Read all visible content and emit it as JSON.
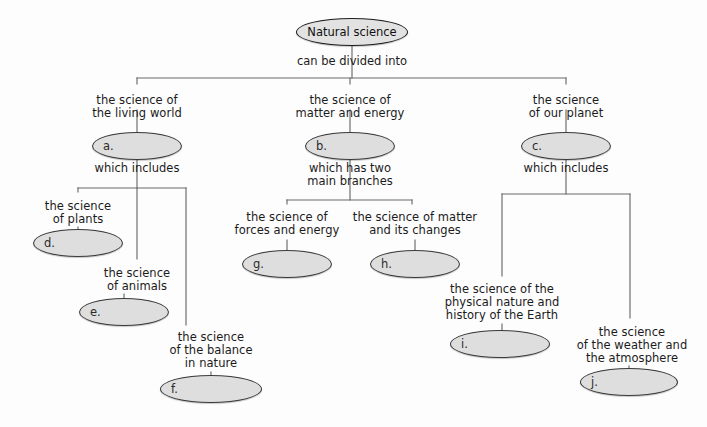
{
  "diagram": {
    "title": "Natural science",
    "type": "concept-map",
    "root": {
      "text": "Natural science",
      "cx": 352,
      "cy": 32,
      "rx": 55,
      "ry": 13
    },
    "connector_labels": [
      {
        "name": "root-connector",
        "text": "can be divided into",
        "x": 352,
        "y": 55
      },
      {
        "name": "living-world-connector",
        "text": "which includes",
        "x": 137,
        "y": 162
      },
      {
        "name": "matter-energy-connector",
        "text": "which has two\nmain branches",
        "x": 350,
        "y": 162
      },
      {
        "name": "our-planet-connector",
        "text": "which includes",
        "x": 566,
        "y": 162
      }
    ],
    "branch_labels": [
      {
        "name": "label-living-world",
        "text": "the science of\nthe living world",
        "x": 137,
        "y": 94
      },
      {
        "name": "label-matter-energy",
        "text": "the science of\nmatter and energy",
        "x": 350,
        "y": 94
      },
      {
        "name": "label-our-planet",
        "text": "the science\nof our planet",
        "x": 566,
        "y": 94
      },
      {
        "name": "label-plants",
        "text": "the science\nof plants",
        "x": 78,
        "y": 200
      },
      {
        "name": "label-animals",
        "text": "the science\nof animals",
        "x": 137,
        "y": 267
      },
      {
        "name": "label-balance",
        "text": "the science\nof the balance\nin nature",
        "x": 211,
        "y": 331
      },
      {
        "name": "label-forces-energy",
        "text": "the science of\nforces and energy",
        "x": 287,
        "y": 211
      },
      {
        "name": "label-matter-changes",
        "text": "the science of matter\nand its changes",
        "x": 415,
        "y": 211
      },
      {
        "name": "label-physical-earth",
        "text": "the science of the\nphysical nature and\nhistory of the Earth",
        "x": 502,
        "y": 283
      },
      {
        "name": "label-weather",
        "text": "the science\nof the weather and\nthe atmosphere",
        "x": 632,
        "y": 326
      }
    ],
    "answer_ellipses": [
      {
        "name": "ellipse-a",
        "key": "a.",
        "cx": 137,
        "cy": 146,
        "rx": 44,
        "ry": 13
      },
      {
        "name": "ellipse-b",
        "key": "b.",
        "cx": 350,
        "cy": 146,
        "rx": 44,
        "ry": 13
      },
      {
        "name": "ellipse-c",
        "key": "c.",
        "cx": 566,
        "cy": 146,
        "rx": 44,
        "ry": 13
      },
      {
        "name": "ellipse-d",
        "key": "d.",
        "cx": 78,
        "cy": 243,
        "rx": 44,
        "ry": 13
      },
      {
        "name": "ellipse-e",
        "key": "e.",
        "cx": 124,
        "cy": 312,
        "rx": 44,
        "ry": 13
      },
      {
        "name": "ellipse-f",
        "key": "f.",
        "cx": 211,
        "cy": 389,
        "rx": 50,
        "ry": 13
      },
      {
        "name": "ellipse-g",
        "key": "g.",
        "cx": 287,
        "cy": 264,
        "rx": 44,
        "ry": 13
      },
      {
        "name": "ellipse-h",
        "key": "h.",
        "cx": 415,
        "cy": 264,
        "rx": 44,
        "ry": 13
      },
      {
        "name": "ellipse-i",
        "key": "i.",
        "cx": 500,
        "cy": 344,
        "rx": 49,
        "ry": 13
      },
      {
        "name": "ellipse-j",
        "key": "j.",
        "cx": 629,
        "cy": 382,
        "rx": 48,
        "ry": 13
      }
    ],
    "wires": [
      {
        "name": "wire-root-stem",
        "d": "M352,45 L352,78"
      },
      {
        "name": "wire-root-distributor",
        "d": "M137,78 L566,78"
      },
      {
        "name": "wire-root-left-drop",
        "d": "M137,78 L137,84"
      },
      {
        "name": "wire-root-mid-drop",
        "d": "M350,78 L350,84"
      },
      {
        "name": "wire-root-right-drop",
        "d": "M566,78 L566,84"
      },
      {
        "name": "wire-living-to-a",
        "d": "M137,110 L137,135"
      },
      {
        "name": "wire-matter-to-b",
        "d": "M350,110 L350,135"
      },
      {
        "name": "wire-planet-to-c",
        "d": "M566,110 L566,135"
      },
      {
        "name": "wire-a-down",
        "d": "M137,157 L137,188"
      },
      {
        "name": "wire-a-distributor",
        "d": "M78,188 L186,188"
      },
      {
        "name": "wire-a-left-drop",
        "d": "M78,188 L78,192"
      },
      {
        "name": "wire-a-mid-drop",
        "d": "M137,188 L137,259"
      },
      {
        "name": "wire-a-right-drop",
        "d": "M186,188 L186,325"
      },
      {
        "name": "wire-plants-to-d",
        "d": "M78,227 L78,233"
      },
      {
        "name": "wire-animals-to-e",
        "d": "M124,294 L124,301"
      },
      {
        "name": "wire-balance-to-f",
        "d": "M211,372 L211,378"
      },
      {
        "name": "wire-b-down",
        "d": "M350,157 L350,200"
      },
      {
        "name": "wire-b-distributor",
        "d": "M287,200 L412,200"
      },
      {
        "name": "wire-b-left-drop",
        "d": "M287,200 L287,204"
      },
      {
        "name": "wire-b-right-drop",
        "d": "M412,200 L412,204"
      },
      {
        "name": "wire-forces-to-g",
        "d": "M287,240 L287,253"
      },
      {
        "name": "wire-matter-to-h",
        "d": "M415,240 L415,253"
      },
      {
        "name": "wire-c-down",
        "d": "M566,157 L566,194"
      },
      {
        "name": "wire-c-distributor",
        "d": "M502,194 L630,194"
      },
      {
        "name": "wire-c-left-drop",
        "d": "M502,194 L502,276"
      },
      {
        "name": "wire-c-right-drop",
        "d": "M630,194 L630,318"
      },
      {
        "name": "wire-earth-to-i",
        "d": "M502,324 L502,333"
      },
      {
        "name": "wire-weather-to-j",
        "d": "M629,366 L629,371"
      }
    ],
    "colors": {
      "background": "#fdfdfd",
      "wire": "#6a6a6a",
      "ellipse_fill": "#dedede",
      "ellipse_stroke": "#3a3a3a",
      "text": "#1b1b1b"
    }
  }
}
